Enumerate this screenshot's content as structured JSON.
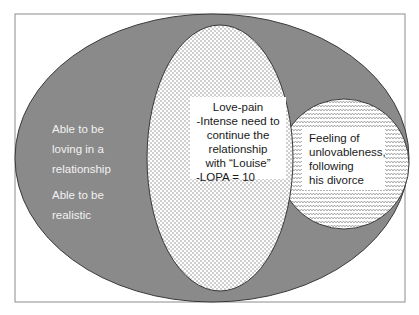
{
  "diagram": {
    "colors": {
      "outer_fill": "#8a8a8a",
      "outer_stroke": "#3a3a3a",
      "frame_stroke": "#8c8c8c",
      "dot_color": "#7a7a7a",
      "zigzag_color": "#8a8a8a",
      "text_light": "#f2f2f2",
      "text_dark": "#1a1a1a"
    },
    "outer_region": {
      "lines": [
        "Able to be",
        "loving in a",
        "relationship"
      ],
      "lines2": [
        "Able to be",
        "realistic"
      ]
    },
    "center_region": {
      "lines": [
        "Love-pain",
        "-Intense need to",
        "continue the",
        "relationship",
        "with “Louise”",
        "-LOPA = 10"
      ]
    },
    "right_region": {
      "lines": [
        "Feeling of",
        "unlovableness,",
        "following",
        "his divorce"
      ]
    }
  }
}
